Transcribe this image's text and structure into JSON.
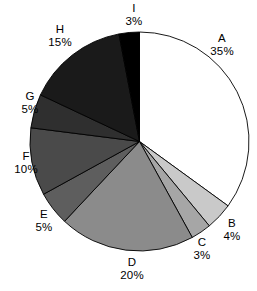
{
  "chart_data": {
    "type": "pie",
    "title": "",
    "subtitle": "",
    "xlabel": "",
    "ylabel": "",
    "legend_position": "none",
    "grid": false,
    "labels_show_percent": true,
    "start_angle_deg": 0,
    "direction": "clockwise",
    "categories": [
      "A",
      "B",
      "C",
      "D",
      "E",
      "F",
      "G",
      "H",
      "I"
    ],
    "values": [
      35,
      4,
      3,
      20,
      5,
      10,
      5,
      15,
      3
    ],
    "units": "%",
    "total": 100,
    "slices": [
      {
        "label": "A",
        "value": 35,
        "value_text": "35%",
        "color": "#ffffff"
      },
      {
        "label": "B",
        "value": 4,
        "value_text": "4%",
        "color": "#c9c9c9"
      },
      {
        "label": "C",
        "value": 3,
        "value_text": "3%",
        "color": "#a6a6a6"
      },
      {
        "label": "D",
        "value": 20,
        "value_text": "20%",
        "color": "#8b8b8b"
      },
      {
        "label": "E",
        "value": 5,
        "value_text": "5%",
        "color": "#5e5e5e"
      },
      {
        "label": "F",
        "value": 10,
        "value_text": "10%",
        "color": "#4a4a4a"
      },
      {
        "label": "G",
        "value": 5,
        "value_text": "5%",
        "color": "#2f2f2f"
      },
      {
        "label": "H",
        "value": 15,
        "value_text": "15%",
        "color": "#1a1a1a"
      },
      {
        "label": "I",
        "value": 3,
        "value_text": "3%",
        "color": "#000000"
      }
    ],
    "stroke_color": "#000000",
    "background": "#ffffff"
  }
}
